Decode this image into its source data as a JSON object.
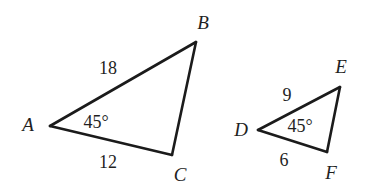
{
  "figure": {
    "background_color": "#ffffff",
    "stroke_color": "#1b1b1b",
    "text_color": "#1f1f1f"
  },
  "triangle_left": {
    "name": "triangle-abc",
    "vertices": [
      {
        "key": "A",
        "label": "A",
        "x": 50,
        "y": 126,
        "label_x": 28,
        "label_y": 124
      },
      {
        "key": "B",
        "label": "B",
        "x": 196,
        "y": 42,
        "label_x": 203,
        "label_y": 22
      },
      {
        "key": "C",
        "label": "C",
        "x": 172,
        "y": 155,
        "label_x": 180,
        "label_y": 174
      }
    ],
    "sides": [
      {
        "key": "AB",
        "label": "18",
        "label_x": 108,
        "label_y": 68
      },
      {
        "key": "AC",
        "label": "12",
        "label_x": 108,
        "label_y": 162
      }
    ],
    "angles": [
      {
        "key": "A",
        "label": "45°",
        "label_x": 96,
        "label_y": 122
      }
    ]
  },
  "triangle_right": {
    "name": "triangle-def",
    "vertices": [
      {
        "key": "D",
        "label": "D",
        "x": 258,
        "y": 130,
        "label_x": 241,
        "label_y": 129
      },
      {
        "key": "E",
        "label": "E",
        "x": 340,
        "y": 87,
        "label_x": 341,
        "label_y": 66
      },
      {
        "key": "F",
        "label": "F",
        "x": 327,
        "y": 152,
        "label_x": 331,
        "label_y": 172
      }
    ],
    "sides": [
      {
        "key": "DE",
        "label": "9",
        "label_x": 287,
        "label_y": 95
      },
      {
        "key": "DF",
        "label": "6",
        "label_x": 284,
        "label_y": 160
      }
    ],
    "angles": [
      {
        "key": "D",
        "label": "45°",
        "label_x": 300,
        "label_y": 126
      }
    ]
  },
  "chart_data": {
    "type": "diagram",
    "shapes": [
      {
        "name": "triangle ABC",
        "points": {
          "A": [
            50,
            126
          ],
          "B": [
            196,
            42
          ],
          "C": [
            172,
            155
          ]
        },
        "side_lengths": {
          "AB": 18,
          "AC": 12
        },
        "angles": {
          "A": 45
        }
      },
      {
        "name": "triangle DEF",
        "points": {
          "D": [
            258,
            130
          ],
          "E": [
            340,
            87
          ],
          "F": [
            327,
            152
          ]
        },
        "side_lengths": {
          "DE": 9,
          "DF": 6
        },
        "angles": {
          "D": 45
        }
      }
    ],
    "scale_factor": 2,
    "annotations": [
      "18",
      "12",
      "45°",
      "9",
      "6",
      "45°"
    ]
  }
}
